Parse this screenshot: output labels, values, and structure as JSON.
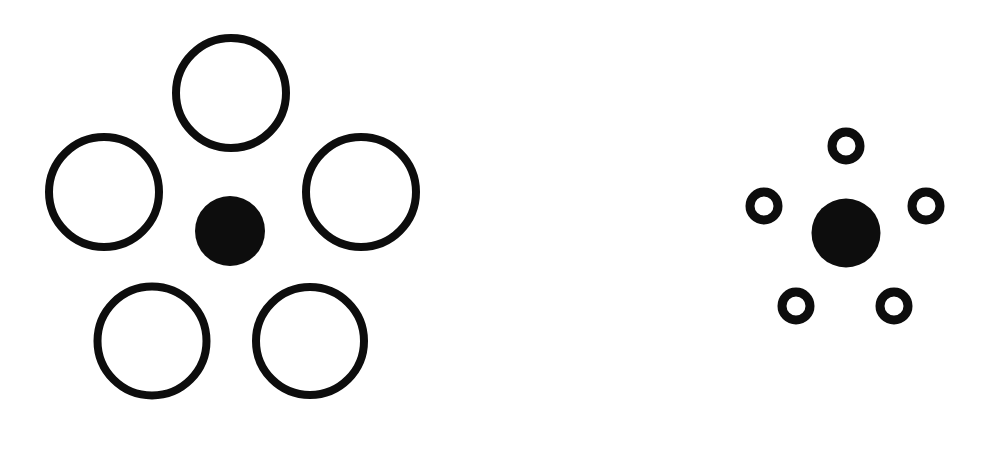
{
  "figure": {
    "title": "Ebbinghaus (Titchener) size illusion",
    "background_color": "#ffffff",
    "ink_color": "#0d0d0d",
    "width": 981,
    "height": 451,
    "ghost_text_top": "",
    "caption": ""
  },
  "chart_data": {
    "type": "scatter",
    "title": "Ebbinghaus (Titchener) size illusion",
    "subtitle": "Two identical target discs surrounded by large versus small inducer circles",
    "xlabel": "",
    "ylabel": "",
    "xlim": [
      0,
      981
    ],
    "ylim": [
      0,
      451
    ],
    "grid": false,
    "legend": "none",
    "units": "pixels",
    "background_color": "#ffffff",
    "ink_color": "#0d0d0d",
    "annotations": [],
    "series": [
      {
        "name": "left-panel-target",
        "role": "target",
        "fill": "solid",
        "color": "#0d0d0d",
        "values": [
          {
            "label": "center-disc",
            "cx": 230,
            "cy": 231,
            "d": 70,
            "stroke": 0
          }
        ]
      },
      {
        "name": "left-panel-inducers",
        "role": "inducer-large",
        "fill": "outline",
        "color": "#0d0d0d",
        "stroke_width": 8,
        "values": [
          {
            "label": "top",
            "cx": 231,
            "cy": 93,
            "d": 118,
            "stroke": 8
          },
          {
            "label": "left",
            "cx": 104,
            "cy": 192,
            "d": 118,
            "stroke": 8
          },
          {
            "label": "right",
            "cx": 361,
            "cy": 192,
            "d": 118,
            "stroke": 8
          },
          {
            "label": "bottom-left",
            "cx": 152,
            "cy": 341,
            "d": 117,
            "stroke": 8
          },
          {
            "label": "bottom-right",
            "cx": 310,
            "cy": 341,
            "d": 116,
            "stroke": 8
          }
        ]
      },
      {
        "name": "right-panel-target",
        "role": "target",
        "fill": "solid",
        "color": "#0d0d0d",
        "values": [
          {
            "label": "center-disc",
            "cx": 846,
            "cy": 233,
            "d": 69,
            "stroke": 0
          }
        ]
      },
      {
        "name": "right-panel-inducers",
        "role": "inducer-small",
        "fill": "outline",
        "color": "#0d0d0d",
        "stroke_width": 9,
        "values": [
          {
            "label": "top",
            "cx": 846,
            "cy": 146,
            "d": 37,
            "stroke": 9
          },
          {
            "label": "left",
            "cx": 764,
            "cy": 206,
            "d": 37,
            "stroke": 9
          },
          {
            "label": "right",
            "cx": 926,
            "cy": 206,
            "d": 37,
            "stroke": 9
          },
          {
            "label": "bottom-left",
            "cx": 796,
            "cy": 306,
            "d": 37,
            "stroke": 9
          },
          {
            "label": "bottom-right",
            "cx": 894,
            "cy": 306,
            "d": 37,
            "stroke": 9
          }
        ]
      }
    ]
  }
}
